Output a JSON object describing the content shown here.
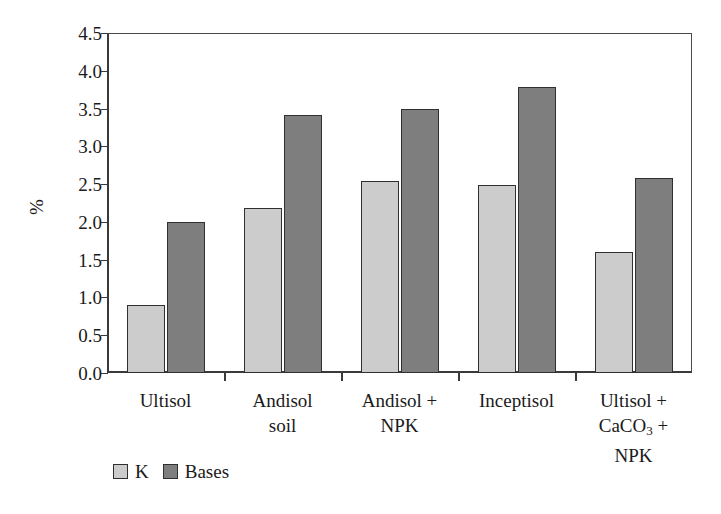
{
  "chart_data": {
    "type": "bar",
    "title": "",
    "xlabel": "",
    "ylabel": "%",
    "ylim": [
      0.0,
      4.5
    ],
    "ytick_step": 0.5,
    "grid": false,
    "legend_position": "bottom-left",
    "categories": [
      "Ultisol",
      "Andisol\nsoil",
      "Andisol +\nNPK",
      "Inceptisol",
      "Ultisol +\nCaCO3 +\nNPK"
    ],
    "series": [
      {
        "name": "K",
        "color": "#cccccc",
        "values": [
          0.9,
          2.18,
          2.54,
          2.49,
          1.6
        ]
      },
      {
        "name": "Bases",
        "color": "#7e7e7e",
        "values": [
          2.0,
          3.41,
          3.5,
          3.79,
          2.58
        ]
      }
    ],
    "ytick_labels": [
      "0.0",
      "0.5",
      "1.0",
      "1.5",
      "2.0",
      "2.5",
      "3.0",
      "3.5",
      "4.0",
      "4.5"
    ],
    "ytick_values": [
      0.0,
      0.5,
      1.0,
      1.5,
      2.0,
      2.5,
      3.0,
      3.5,
      4.0,
      4.5
    ]
  },
  "axis": {
    "y_title": "%"
  },
  "legend": {
    "items": [
      {
        "label": "K",
        "swatch": "light-gray-swatch"
      },
      {
        "label": "Bases",
        "swatch": "dark-gray-swatch"
      }
    ]
  },
  "xlabels": [
    {
      "line1": "Ultisol",
      "line2": "",
      "line3": ""
    },
    {
      "line1": "Andisol",
      "line2": "soil",
      "line3": ""
    },
    {
      "line1": "Andisol +",
      "line2": "NPK",
      "line3": ""
    },
    {
      "line1": "Inceptisol",
      "line2": "",
      "line3": ""
    },
    {
      "line1": "Ultisol +",
      "line2": "CaCO3 +",
      "line3": "NPK"
    }
  ]
}
